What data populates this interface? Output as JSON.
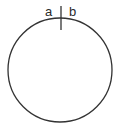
{
  "diagram": {
    "labels": {
      "left": "a",
      "right": "b"
    },
    "colors": {
      "stroke": "#333333",
      "text": "#2a2a2a",
      "background": "#ffffff"
    }
  }
}
